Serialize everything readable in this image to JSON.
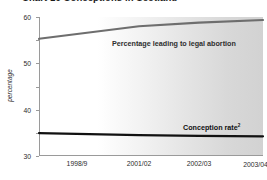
{
  "chart_data": {
    "type": "line",
    "title": "Chart 10 Conceptions in Scotland",
    "xlabel": "",
    "ylabel": "percentage",
    "categories": [
      "1998/9",
      "2001/02",
      "2002/03",
      "2003/04"
    ],
    "category_footnotes": [
      "",
      "",
      "",
      "3"
    ],
    "ylim": [
      0,
      60
    ],
    "yticks": [
      0,
      10,
      20,
      30,
      40,
      50,
      60
    ],
    "ytick_labels": [
      "0",
      "10",
      "20",
      "30",
      "40",
      "50",
      "60"
    ],
    "grid": false,
    "legend_position": "inline-annotation",
    "series": [
      {
        "name": "Percentage leading to legal abortion",
        "footnote": "",
        "color": "#6e6e6e",
        "values": [
          50.6,
          56.0,
          57.6,
          58.7
        ]
      },
      {
        "name": "Conception rate",
        "footnote": "2",
        "color": "#111111",
        "values": [
          9.9,
          9.0,
          8.7,
          8.5
        ]
      }
    ],
    "annotations": [
      {
        "text": "Percentage leading to legal abortion",
        "series": 0
      },
      {
        "text": "Conception rate",
        "series": 1
      }
    ],
    "background": {
      "gradient_from": "#ffffff",
      "gradient_to": "#d2d2d2"
    }
  }
}
